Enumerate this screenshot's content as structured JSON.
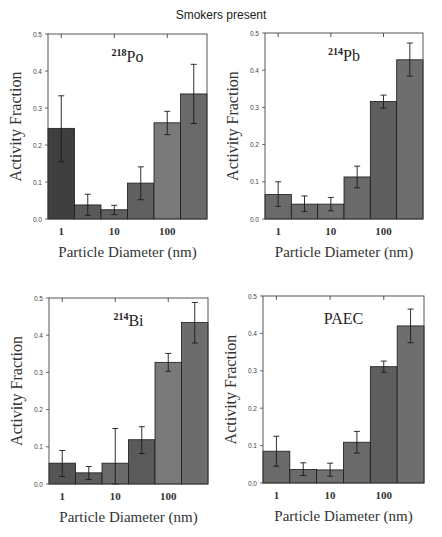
{
  "figure": {
    "title": "Smokers present"
  },
  "chart_data": [
    {
      "type": "bar",
      "title": "218Po",
      "title_parts": {
        "superscript": "218",
        "base": "Po"
      },
      "xlabel": "Particle Diameter (nm)",
      "ylabel": "Activity Fraction",
      "xscale": "log",
      "xticks": [
        "1",
        "10",
        "100"
      ],
      "yticks": [
        "0.0",
        "0.1",
        "0.2",
        "0.3",
        "0.4",
        "0.5"
      ],
      "ylim": [
        0,
        0.5
      ],
      "grid": false,
      "bins": 6,
      "values": [
        0.245,
        0.038,
        0.025,
        0.097,
        0.26,
        0.338
      ],
      "error_low": [
        0.155,
        0.01,
        0.012,
        0.052,
        0.228,
        0.258
      ],
      "error_high": [
        0.333,
        0.067,
        0.037,
        0.141,
        0.291,
        0.418
      ],
      "bar_colors": [
        "#3f3f3f",
        "#5a5a5a",
        "#5e5e5e",
        "#606060",
        "#7a7a7a",
        "#6a6a6a"
      ]
    },
    {
      "type": "bar",
      "title": "214Pb",
      "title_parts": {
        "superscript": "214",
        "base": "Pb"
      },
      "xlabel": "Particle Diameter (nm)",
      "ylabel": "Activity Fraction",
      "xscale": "log",
      "xticks": [
        "1",
        "10",
        "100"
      ],
      "yticks": [
        "0.0",
        "0.1",
        "0.2",
        "0.3",
        "0.4",
        "0.5"
      ],
      "ylim": [
        0,
        0.5
      ],
      "grid": false,
      "bins": 6,
      "values": [
        0.066,
        0.04,
        0.04,
        0.113,
        0.316,
        0.428
      ],
      "error_low": [
        0.034,
        0.02,
        0.022,
        0.084,
        0.298,
        0.384
      ],
      "error_high": [
        0.1,
        0.062,
        0.058,
        0.142,
        0.333,
        0.473
      ],
      "bar_colors": [
        "#6a6a6a",
        "#6a6a6a",
        "#707070",
        "#6a6a6a",
        "#5e5e5e",
        "#6e6e6e"
      ]
    },
    {
      "type": "bar",
      "title": "214Bi",
      "title_parts": {
        "superscript": "214",
        "base": "Bi"
      },
      "xlabel": "Particle Diameter (nm)",
      "ylabel": "Activity Fraction",
      "xscale": "log",
      "xticks": [
        "1",
        "10",
        "100"
      ],
      "yticks": [
        "0.0",
        "0.1",
        "0.2",
        "0.3",
        "0.4",
        "0.5"
      ],
      "ylim": [
        0,
        0.5
      ],
      "grid": false,
      "bins": 6,
      "values": [
        0.056,
        0.03,
        0.056,
        0.119,
        0.327,
        0.434
      ],
      "error_low": [
        0.02,
        0.012,
        0.0,
        0.082,
        0.303,
        0.379
      ],
      "error_high": [
        0.09,
        0.047,
        0.149,
        0.154,
        0.351,
        0.488
      ],
      "bar_colors": [
        "#555555",
        "#5c5c5c",
        "#6a6a6a",
        "#5a5a5a",
        "#7a7a7a",
        "#6c6c6c"
      ]
    },
    {
      "type": "bar",
      "title": "PAEC",
      "title_parts": {
        "superscript": "",
        "base": "PAEC"
      },
      "xlabel": "Particle Diameter (nm)",
      "ylabel": "Activity Fraction",
      "xscale": "log",
      "xticks": [
        "1",
        "10",
        "100"
      ],
      "yticks": [
        "0.0",
        "0.1",
        "0.2",
        "0.3",
        "0.4",
        "0.5"
      ],
      "ylim": [
        0,
        0.5
      ],
      "grid": false,
      "bins": 6,
      "values": [
        0.085,
        0.036,
        0.035,
        0.109,
        0.311,
        0.42
      ],
      "error_low": [
        0.045,
        0.02,
        0.018,
        0.08,
        0.296,
        0.375
      ],
      "error_high": [
        0.125,
        0.054,
        0.053,
        0.138,
        0.326,
        0.465
      ],
      "bar_colors": [
        "#6a6a6a",
        "#6a6a6a",
        "#707070",
        "#6a6a6a",
        "#5e5e5e",
        "#6e6e6e"
      ]
    }
  ]
}
